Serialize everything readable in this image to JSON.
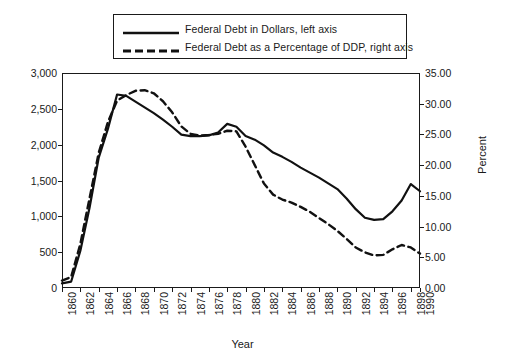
{
  "chart_data": {
    "type": "line",
    "title": "",
    "xlabel": "Year",
    "ylabel": "",
    "ylabel_right": "Percent",
    "grid": false,
    "legend_position": "top-center",
    "x": [
      1860,
      1861,
      1862,
      1863,
      1864,
      1865,
      1866,
      1867,
      1868,
      1869,
      1870,
      1871,
      1872,
      1873,
      1874,
      1875,
      1876,
      1877,
      1878,
      1879,
      1880,
      1881,
      1882,
      1883,
      1884,
      1885,
      1886,
      1887,
      1888,
      1889,
      1890,
      1891,
      1892,
      1893,
      1894,
      1895,
      1896,
      1897,
      1898,
      1990
    ],
    "xtick_labels": [
      "1860",
      "1862",
      "1864",
      "1866",
      "1868",
      "1870",
      "1872",
      "1874",
      "1876",
      "1878",
      "1880",
      "1882",
      "1884",
      "1886",
      "1888",
      "1890",
      "1892",
      "1894",
      "1896",
      "1898",
      "1990"
    ],
    "ylim": [
      0,
      3000
    ],
    "ytick_labels": [
      "0",
      "500",
      "1,000",
      "1,500",
      "2,000",
      "2,500",
      "3,000"
    ],
    "ytick_values": [
      0,
      500,
      1000,
      1500,
      2000,
      2500,
      3000
    ],
    "ylim_right": [
      0,
      35
    ],
    "ytick_labels_right": [
      "0.00",
      "5.00",
      "10.00",
      "15.00",
      "20.00",
      "25.00",
      "30.00",
      "35.00"
    ],
    "ytick_values_right": [
      0,
      5,
      10,
      15,
      20,
      25,
      30,
      35
    ],
    "series": [
      {
        "name": "Federal Debt in Dollars,  left axis",
        "axis": "left",
        "style": "solid",
        "color": "#111111",
        "values": [
          65,
          90,
          520,
          1120,
          1820,
          2220,
          2700,
          2680,
          2600,
          2520,
          2440,
          2350,
          2250,
          2140,
          2120,
          2120,
          2130,
          2170,
          2290,
          2250,
          2120,
          2070,
          1990,
          1890,
          1830,
          1760,
          1680,
          1610,
          1540,
          1460,
          1380,
          1250,
          1100,
          980,
          950,
          960,
          1070,
          1220,
          1450,
          1350
        ]
      },
      {
        "name": "Federal Debt as a Percentage of DDP, right axis",
        "axis": "right",
        "style": "dashed",
        "color": "#111111",
        "values": [
          1.2,
          1.8,
          7.2,
          14.6,
          22.0,
          27.0,
          30.5,
          31.4,
          32.1,
          32.2,
          31.7,
          30.4,
          28.6,
          26.3,
          25.1,
          24.8,
          24.9,
          25.1,
          25.6,
          25.5,
          23.0,
          20.0,
          17.0,
          15.2,
          14.4,
          13.9,
          13.2,
          12.4,
          11.4,
          10.4,
          9.3,
          8.0,
          6.6,
          5.8,
          5.3,
          5.4,
          6.3,
          7.0,
          6.6,
          5.6
        ]
      }
    ]
  },
  "legend": {
    "items": [
      {
        "label": "Federal Debt in Dollars,  left axis",
        "style": "solid"
      },
      {
        "label": "Federal Debt as a Percentage of DDP, right axis",
        "style": "dashed"
      }
    ]
  },
  "axes": {
    "x_title": "Year",
    "y_right_title": "Percent"
  }
}
